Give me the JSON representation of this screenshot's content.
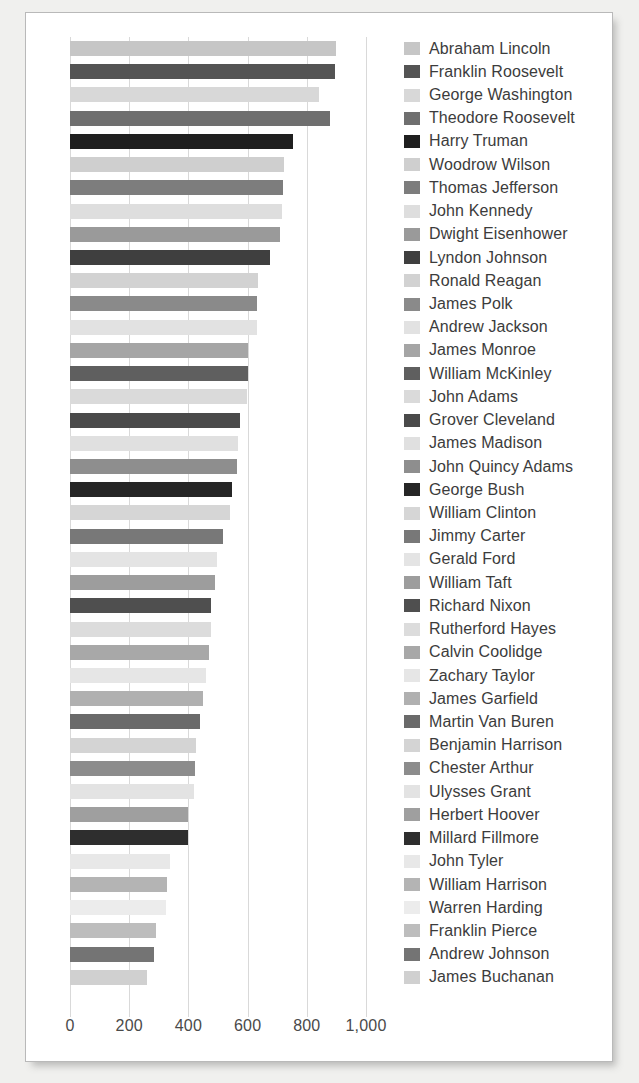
{
  "chart_data": {
    "type": "bar",
    "orientation": "horizontal",
    "title": "",
    "xlabel": "",
    "ylabel": "",
    "xlim": [
      0,
      1000
    ],
    "xticks": [
      0,
      200,
      400,
      600,
      800,
      1000
    ],
    "xtick_labels": [
      "0",
      "200",
      "400",
      "600",
      "800",
      "1,000"
    ],
    "grid": true,
    "legend_position": "right",
    "categories": [
      "Abraham Lincoln",
      "Franklin Roosevelt",
      "George Washington",
      "Theodore Roosevelt",
      "Harry Truman",
      "Woodrow Wilson",
      "Thomas Jefferson",
      "John Kennedy",
      "Dwight Eisenhower",
      "Lyndon Johnson",
      "Ronald Reagan",
      "James Polk",
      "Andrew Jackson",
      "James Monroe",
      "William McKinley",
      "John Adams",
      "Grover Cleveland",
      "James Madison",
      "John Quincy Adams",
      "George Bush",
      "William Clinton",
      "Jimmy Carter",
      "Gerald Ford",
      "William Taft",
      "Richard Nixon",
      "Rutherford Hayes",
      "Calvin Coolidge",
      "Zachary Taylor",
      "James Garfield",
      "Martin Van Buren",
      "Benjamin Harrison",
      "Chester Arthur",
      "Ulysses Grant",
      "Herbert Hoover",
      "Millard Fillmore",
      "John Tyler",
      "William Harrison",
      "Warren Harding",
      "Franklin Pierce",
      "Andrew Johnson",
      "James Buchanan"
    ],
    "values": [
      900,
      896,
      842,
      877,
      753,
      723,
      721,
      715,
      711,
      675,
      634,
      632,
      632,
      602,
      601,
      599,
      576,
      567,
      564,
      548,
      539,
      518,
      496,
      491,
      477,
      477,
      469,
      461,
      450,
      439,
      425,
      421,
      418,
      400,
      397,
      337,
      329,
      326,
      290,
      283,
      259
    ],
    "bar_colors": [
      "#c6c6c6",
      "#545454",
      "#d8d8d8",
      "#6f6f6f",
      "#1f1f1f",
      "#cfcfcf",
      "#7d7d7d",
      "#dedede",
      "#9a9a9a",
      "#3f3f3f",
      "#d2d2d2",
      "#8a8a8a",
      "#e2e2e2",
      "#a5a5a5",
      "#5f5f5f",
      "#dadada",
      "#4a4a4a",
      "#e0e0e0",
      "#8e8e8e",
      "#262626",
      "#d6d6d6",
      "#787878",
      "#e4e4e4",
      "#9d9d9d",
      "#4f4f4f",
      "#dcdcdc",
      "#a8a8a8",
      "#e6e6e6",
      "#b0b0b0",
      "#6a6a6a",
      "#d4d4d4",
      "#8c8c8c",
      "#e3e3e3",
      "#9f9f9f",
      "#2e2e2e",
      "#e8e8e8",
      "#b4b4b4",
      "#ececec",
      "#bdbdbd",
      "#747474",
      "#d0d0d0"
    ]
  },
  "style": {
    "card_background": "#ffffff",
    "page_background": "#f0f0ee",
    "card_border": "#b9b9b9",
    "gridline_color": "#d9d9d9",
    "tick_text_color": "#4a4a4a",
    "legend_text_color": "#3c3c3c"
  }
}
